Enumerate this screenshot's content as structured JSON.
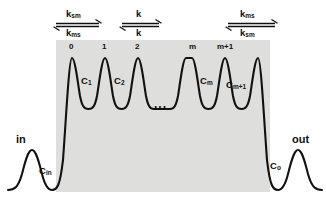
{
  "figure": {
    "type": "energy-barrier-profile",
    "membrane_band_color": "#dededc",
    "curve_color": "#111111",
    "background_color": "#ffffff"
  },
  "rate_arrows": [
    {
      "id": "entry",
      "forward_label": "k",
      "forward_sub": "sm",
      "backward_label": "k",
      "backward_sub": "ms",
      "x": 56,
      "width": 46
    },
    {
      "id": "internal",
      "forward_label": "k",
      "forward_sub": "",
      "backward_label": "k",
      "backward_sub": "",
      "x": 122,
      "width": 40
    },
    {
      "id": "exit",
      "forward_label": "k",
      "forward_sub": "ms",
      "backward_label": "k",
      "backward_sub": "sm",
      "x": 228,
      "width": 48
    }
  ],
  "barriers": [
    {
      "label": "0",
      "x": 72
    },
    {
      "label": "1",
      "x": 105
    },
    {
      "label": "2",
      "x": 138
    },
    {
      "label": "m",
      "x": 192
    },
    {
      "label": "m+1",
      "x": 225
    }
  ],
  "wells": [
    {
      "label": "C",
      "sub": "1",
      "x": 84
    },
    {
      "label": "C",
      "sub": "2",
      "x": 117
    },
    {
      "label": "C",
      "sub": "m",
      "x": 204
    },
    {
      "label": "C",
      "sub": "m+1",
      "x": 231
    }
  ],
  "ellipsis": {
    "text": "...",
    "x": 157,
    "y": 103
  },
  "ports": {
    "in": {
      "label": "in",
      "well_label": "C",
      "well_sub": "in"
    },
    "out": {
      "label": "out",
      "well_label": "C",
      "well_sub": "o"
    }
  },
  "membrane_band": {
    "x": 56,
    "y": 40,
    "width": 214,
    "height": 152
  }
}
